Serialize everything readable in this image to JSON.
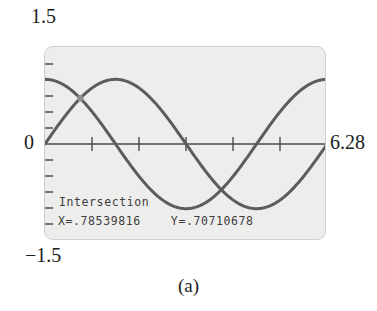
{
  "figure": {
    "caption": "(a)",
    "device": "graphing-calculator-screen"
  },
  "axis_labels": {
    "y_max": "1.5",
    "y_min": "−1.5",
    "y_zero": "0",
    "x_max": "6.28"
  },
  "screen_readout": {
    "title": "Intersection",
    "values": "X=.78539816    Y=.70710678",
    "x_value": ".78539816",
    "y_value": ".70710678"
  },
  "colors": {
    "screen_background": "#ededec",
    "screen_border": "#cfcfcf",
    "curve": "#5c5c5c",
    "axis": "#4a4a4a",
    "text": "#3d3d3d",
    "label_text": "#1c1c1c"
  },
  "chart_data": {
    "type": "line",
    "title": "",
    "xlabel": "",
    "ylabel": "",
    "xlim": [
      0,
      6.28
    ],
    "ylim": [
      -1.5,
      1.5
    ],
    "grid": false,
    "legend": "none",
    "x_ticks": [
      1.0471975,
      2.0943951,
      3.1415927,
      4.1887902,
      5.2359878
    ],
    "y_ticks": [
      -1.25,
      -1.0,
      -0.75,
      -0.5,
      -0.25,
      0.25,
      0.5,
      0.75,
      1.0,
      1.25
    ],
    "x_tick_labels": [
      "",
      "",
      "",
      "",
      ""
    ],
    "y_tick_labels": [
      "",
      "",
      "",
      "",
      "",
      "",
      "",
      "",
      "",
      ""
    ],
    "series": [
      {
        "name": "y = cos(x)",
        "function": "cos",
        "amplitude": 1.0,
        "phase": 0,
        "x": [
          0,
          0.3927,
          0.7854,
          1.1781,
          1.5708,
          1.9635,
          2.3562,
          2.7489,
          3.1416,
          3.5343,
          3.927,
          4.3197,
          4.7124,
          5.1051,
          5.4978,
          5.8905,
          6.2832
        ],
        "values": [
          1.0,
          0.9239,
          0.7071,
          0.3827,
          0.0,
          -0.3827,
          -0.7071,
          -0.9239,
          -1.0,
          -0.9239,
          -0.7071,
          -0.3827,
          0.0,
          0.3827,
          0.7071,
          0.9239,
          1.0
        ]
      },
      {
        "name": "y = sin(x)",
        "function": "sin",
        "amplitude": 1.0,
        "phase": 0,
        "x": [
          0,
          0.3927,
          0.7854,
          1.1781,
          1.5708,
          1.9635,
          2.3562,
          2.7489,
          3.1416,
          3.5343,
          3.927,
          4.3197,
          4.7124,
          5.1051,
          5.4978,
          5.8905,
          6.2832
        ],
        "values": [
          0.0,
          0.3827,
          0.7071,
          0.9239,
          1.0,
          0.9239,
          0.7071,
          0.3827,
          0.0,
          -0.3827,
          -0.7071,
          -0.9239,
          -1.0,
          -0.9239,
          -0.7071,
          -0.3827,
          0.0
        ]
      }
    ],
    "annotations": [
      {
        "label": "Intersection",
        "x": 0.78539816,
        "y": 0.70710678,
        "marker": "cursor-cross"
      }
    ]
  }
}
